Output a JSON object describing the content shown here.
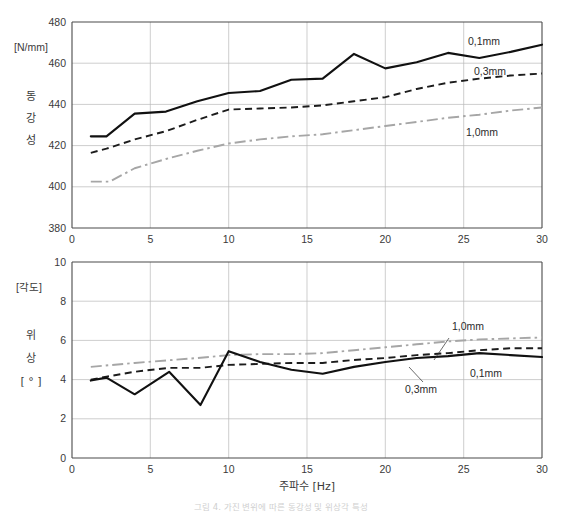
{
  "figure": {
    "caption": "그림 4. 가진 변위에 따른 동강성 및 위상각 특성"
  },
  "charts": {
    "top": {
      "y_unit_label": "[N/mm]",
      "y_title_chars": [
        "동",
        "강",
        "성"
      ],
      "y_ticks": [
        "380",
        "400",
        "420",
        "440",
        "460",
        "480"
      ],
      "x_ticks": [
        "0",
        "5",
        "10",
        "15",
        "20",
        "25",
        "30"
      ],
      "series_labels": {
        "s1": "0,1mm",
        "s2": "0,3mm",
        "s3": "1,0mm"
      }
    },
    "bottom": {
      "y_unit_label": "[각도]",
      "y_title_chars": [
        "위",
        "상",
        "[ ° ]"
      ],
      "y_ticks": [
        "0",
        "2",
        "4",
        "6",
        "8",
        "10"
      ],
      "x_ticks": [
        "0",
        "5",
        "10",
        "15",
        "20",
        "25",
        "30"
      ],
      "x_title": "주파수  [Hz]",
      "series_labels": {
        "s1": "0,1mm",
        "s2": "0,3mm",
        "s3": "1,0mm"
      }
    }
  },
  "chart_data": [
    {
      "type": "line",
      "id": "dynamic-stiffness",
      "title": "동강성",
      "xlabel": "주파수 [Hz]",
      "ylabel": "동강성 [N/mm]",
      "xlim": [
        0,
        30
      ],
      "ylim": [
        380,
        480
      ],
      "xticks": [
        0,
        5,
        10,
        15,
        20,
        25,
        30
      ],
      "yticks": [
        380,
        400,
        420,
        440,
        460,
        480
      ],
      "grid": true,
      "legend_position": "inline-annotation",
      "series": [
        {
          "name": "0,1mm",
          "style": "solid",
          "color": "#111111",
          "x": [
            1.2,
            2.2,
            4.0,
            6.0,
            8.0,
            10.0,
            12.0,
            14.0,
            16.0,
            18.0,
            20.0,
            22.0,
            24.0,
            26.0,
            28.0,
            30.0
          ],
          "y": [
            424.5,
            424.5,
            435.5,
            436.5,
            441.5,
            445.5,
            446.5,
            452.0,
            452.5,
            464.5,
            457.5,
            460.5,
            465.0,
            462.5,
            465.5,
            469.0
          ]
        },
        {
          "name": "0,3mm",
          "style": "dashed",
          "color": "#1c1c1c",
          "x": [
            1.2,
            2.2,
            4.0,
            6.0,
            8.0,
            10.0,
            12.0,
            14.0,
            16.0,
            18.0,
            20.0,
            22.0,
            24.0,
            26.0,
            28.0,
            30.0
          ],
          "y": [
            416.5,
            418.5,
            423.0,
            427.0,
            432.5,
            437.5,
            438.0,
            438.5,
            439.5,
            441.5,
            443.5,
            447.5,
            450.5,
            452.5,
            454.0,
            455.0
          ]
        },
        {
          "name": "1,0mm",
          "style": "dashdot",
          "color": "#a6a6a6",
          "x": [
            1.2,
            2.4,
            4.0,
            6.0,
            8.0,
            10.0,
            12.0,
            14.0,
            16.0,
            18.0,
            20.0,
            22.0,
            24.0,
            26.0,
            28.0,
            30.0
          ],
          "y": [
            402.5,
            402.5,
            409.0,
            413.5,
            417.5,
            421.0,
            423.0,
            424.5,
            425.5,
            427.5,
            429.5,
            431.5,
            433.5,
            435.0,
            437.0,
            438.5
          ]
        }
      ]
    },
    {
      "type": "line",
      "id": "phase-angle",
      "title": "위상",
      "xlabel": "주파수 [Hz]",
      "ylabel": "위상 [°]",
      "xlim": [
        0,
        30
      ],
      "ylim": [
        0,
        10
      ],
      "xticks": [
        0,
        5,
        10,
        15,
        20,
        25,
        30
      ],
      "yticks": [
        0,
        2,
        4,
        6,
        8,
        10
      ],
      "grid": true,
      "legend_position": "inline-annotation",
      "series": [
        {
          "name": "0,1mm",
          "style": "solid",
          "color": "#111111",
          "x": [
            1.2,
            2.2,
            4.0,
            6.2,
            8.2,
            10.0,
            12.0,
            14.0,
            16.0,
            18.0,
            20.0,
            22.0,
            24.0,
            26.0,
            28.0,
            30.0
          ],
          "y": [
            3.95,
            4.1,
            3.25,
            4.4,
            2.7,
            5.45,
            4.9,
            4.5,
            4.3,
            4.65,
            4.9,
            5.1,
            5.2,
            5.35,
            5.25,
            5.15
          ]
        },
        {
          "name": "0,3mm",
          "style": "dashed",
          "color": "#1c1c1c",
          "x": [
            1.2,
            2.2,
            4.0,
            6.2,
            8.2,
            10.0,
            12.0,
            14.0,
            16.0,
            18.0,
            20.0,
            22.0,
            24.0,
            26.0,
            28.0,
            30.0
          ],
          "y": [
            4.0,
            4.15,
            4.4,
            4.6,
            4.6,
            4.75,
            4.8,
            4.85,
            4.85,
            5.0,
            5.1,
            5.25,
            5.35,
            5.5,
            5.6,
            5.6
          ]
        },
        {
          "name": "1,0mm",
          "style": "dashdot",
          "color": "#a6a6a6",
          "x": [
            1.2,
            4.0,
            8.0,
            10.0,
            12.0,
            14.0,
            16.0,
            18.0,
            20.0,
            22.0,
            24.0,
            26.0,
            28.0,
            30.0
          ],
          "y": [
            4.65,
            4.85,
            5.1,
            5.25,
            5.3,
            5.3,
            5.35,
            5.5,
            5.65,
            5.8,
            5.95,
            6.05,
            6.1,
            6.15
          ]
        }
      ]
    }
  ]
}
